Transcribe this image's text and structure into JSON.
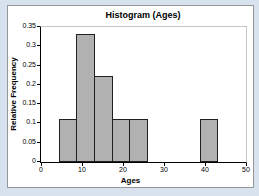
{
  "page": {
    "background_color": "#d8e1ee"
  },
  "chart": {
    "frame_border_color": "#979797",
    "plot_border_color": "#c6c6c6",
    "bar_fill_color": "#b1b1b1",
    "bar_border_color": "#1f1f1f",
    "axis_color": "#000000"
  },
  "chart_data": {
    "type": "bar",
    "subtype": "histogram",
    "title": "Histogram (Ages)",
    "xlabel": "Ages",
    "ylabel": "Relative Frequency",
    "xlim": [
      0,
      50
    ],
    "ylim": [
      0,
      0.35
    ],
    "x_ticks": [
      "0",
      "10",
      "20",
      "30",
      "40",
      "50"
    ],
    "y_ticks": [
      "0.35",
      "0.3",
      "0.25",
      "0.2",
      "0.15",
      "0.1",
      "0.05",
      "0"
    ],
    "grid": false,
    "legend": null,
    "bin_width": 4.3,
    "bins": [
      {
        "start": 4.3,
        "end": 8.6,
        "value": 0.111
      },
      {
        "start": 8.6,
        "end": 12.9,
        "value": 0.333
      },
      {
        "start": 12.9,
        "end": 17.2,
        "value": 0.222
      },
      {
        "start": 17.2,
        "end": 21.5,
        "value": 0.111
      },
      {
        "start": 21.5,
        "end": 25.8,
        "value": 0.111
      },
      {
        "start": 25.8,
        "end": 30.1,
        "value": 0
      },
      {
        "start": 30.1,
        "end": 34.4,
        "value": 0
      },
      {
        "start": 34.4,
        "end": 38.7,
        "value": 0
      },
      {
        "start": 38.7,
        "end": 43.0,
        "value": 0.111
      }
    ]
  }
}
